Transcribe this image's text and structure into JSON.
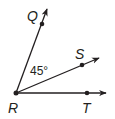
{
  "diagram": {
    "type": "geometry-angle-rays",
    "vertex": {
      "label": "R",
      "x": 16,
      "y": 93
    },
    "rays": [
      {
        "name": "RQ",
        "point_label": "Q",
        "point": {
          "x": 42,
          "y": 24
        },
        "end": {
          "x": 48,
          "y": 6
        }
      },
      {
        "name": "RS",
        "point_label": "S",
        "point": {
          "x": 82,
          "y": 65
        },
        "end": {
          "x": 101,
          "y": 57
        }
      },
      {
        "name": "RT",
        "point_label": "T",
        "point": {
          "x": 87,
          "y": 93
        },
        "end": {
          "x": 108,
          "y": 93
        }
      }
    ],
    "angle_label": "45°",
    "angle_name": "QRS",
    "labels": {
      "Q": "Q",
      "S": "S",
      "T": "T",
      "R": "R"
    },
    "colors": {
      "stroke": "#231f20",
      "background": "#ffffff"
    }
  }
}
